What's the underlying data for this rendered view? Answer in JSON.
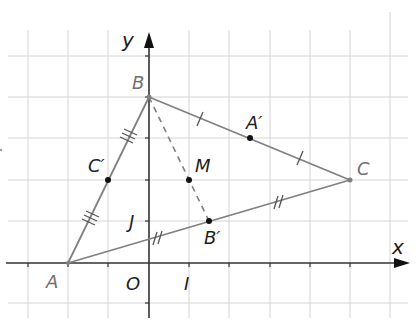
{
  "figure": {
    "colors": {
      "grid": "#d4d4d4",
      "axis": "#333333",
      "segment": "#808080",
      "point": "#111111",
      "vertex_label": "#707070",
      "point_label": "#1e1e1e"
    },
    "axes": {
      "x_label": "x",
      "y_label": "y",
      "origin_label": "O",
      "unit_x_label": "I",
      "unit_y_label": "J"
    },
    "vertices": [
      {
        "name": "A",
        "x": -2,
        "y": 0
      },
      {
        "name": "B",
        "x": 0,
        "y": 4
      },
      {
        "name": "C",
        "x": 5,
        "y": 2
      }
    ],
    "midpoints": [
      {
        "name": "C′",
        "x": -1,
        "y": 2,
        "segment": "AB"
      },
      {
        "name": "A′",
        "x": 2.5,
        "y": 3,
        "segment": "BC"
      },
      {
        "name": "B′",
        "x": 1.5,
        "y": 1,
        "segment": "AC"
      },
      {
        "name": "M",
        "x": 1,
        "y": 2,
        "segment": "BB′"
      }
    ],
    "segments": [
      {
        "from": "A",
        "to": "B",
        "style": "solid",
        "tick_marks": 3
      },
      {
        "from": "B",
        "to": "C",
        "style": "solid",
        "tick_marks": 1
      },
      {
        "from": "A",
        "to": "C",
        "style": "solid",
        "tick_marks": 2
      },
      {
        "from": "B",
        "to": "B′",
        "style": "dashed",
        "tick_marks": 0
      }
    ],
    "labels": {
      "A": "A",
      "B": "B",
      "C": "C",
      "A_prime": "A′",
      "B_prime": "B′",
      "C_prime": "C′",
      "M": "M"
    }
  }
}
